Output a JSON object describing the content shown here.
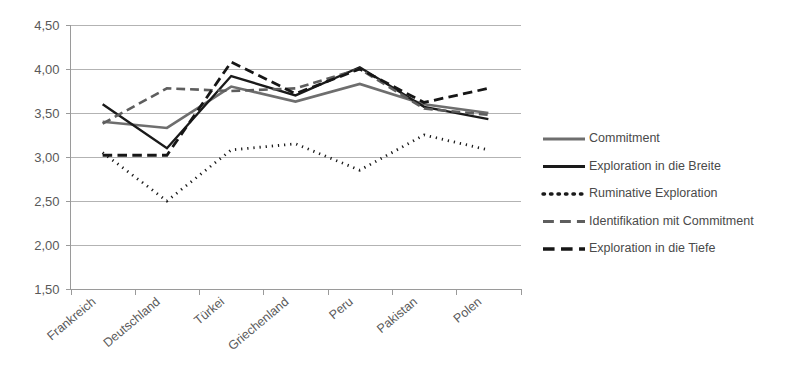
{
  "chart_data": {
    "type": "line",
    "title": "",
    "subtitle": "",
    "xlabel": "",
    "ylabel": "",
    "grid": true,
    "legend_position": "right",
    "ylim": [
      1.5,
      4.5
    ],
    "ytick_labels": [
      "4,50",
      "4,00",
      "3,50",
      "3,00",
      "2,50",
      "2,00",
      "1,50"
    ],
    "ytick_values": [
      4.5,
      4.0,
      3.5,
      3.0,
      2.5,
      2.0,
      1.5
    ],
    "categories": [
      "Frankreich",
      "Deutschland",
      "Türkei",
      "Griechenland",
      "Peru",
      "Pakistan",
      "Polen"
    ],
    "series": [
      {
        "name": "Commitment",
        "values": [
          3.4,
          3.33,
          3.8,
          3.63,
          3.83,
          3.6,
          3.5
        ],
        "color": "#6e6e6e",
        "style": "solid",
        "width": 2.6
      },
      {
        "name": "Exploration in die Breite",
        "values": [
          3.6,
          3.1,
          3.92,
          3.7,
          4.02,
          3.57,
          3.43
        ],
        "color": "#1a1a1a",
        "style": "solid",
        "width": 2.4
      },
      {
        "name": "Ruminative Exploration",
        "values": [
          3.05,
          2.5,
          3.08,
          3.15,
          2.85,
          3.25,
          3.08
        ],
        "color": "#1a1a1a",
        "style": "dotted",
        "width": 2.8
      },
      {
        "name": "Identifikation mit Commitment",
        "values": [
          3.38,
          3.78,
          3.75,
          3.78,
          4.0,
          3.55,
          3.48
        ],
        "color": "#5e5e5e",
        "style": "dashed",
        "width": 2.6
      },
      {
        "name": "Exploration in die Tiefe",
        "values": [
          3.02,
          3.02,
          4.08,
          3.72,
          4.0,
          3.62,
          3.78
        ],
        "color": "#161616",
        "style": "dashed",
        "width": 2.8
      }
    ]
  },
  "legend": {
    "entries": [
      {
        "label": "Commitment"
      },
      {
        "label": "Exploration in die Breite"
      },
      {
        "label": "Ruminative Exploration"
      },
      {
        "label": "Identifikation mit Commitment"
      },
      {
        "label": "Exploration in die Tiefe"
      }
    ]
  }
}
